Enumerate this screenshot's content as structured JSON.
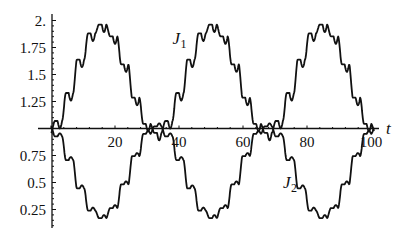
{
  "chart_data": {
    "type": "line",
    "title": "",
    "xlabel": "t",
    "ylabel": "",
    "xlim": [
      0,
      102
    ],
    "ylim": [
      0.1,
      2.05
    ],
    "axis_origin": {
      "x": 0,
      "y": 1.0
    },
    "grid": false,
    "legend": "inline labels",
    "x_ticks": [
      20,
      40,
      60,
      80,
      100
    ],
    "x_tick_labels": [
      "20",
      "40",
      "60",
      "80",
      "100"
    ],
    "y_ticks": [
      2.0,
      1.75,
      1.5,
      1.25,
      0.75,
      0.5,
      0.25
    ],
    "y_tick_labels": [
      "2.",
      "1.75",
      "1.5",
      "1.25",
      "0.75",
      "0.5",
      "0.25"
    ],
    "annotations": [
      {
        "text": "J",
        "subscript": "1",
        "x": 38,
        "y": 1.78,
        "series": "J1"
      },
      {
        "text": "J",
        "subscript": "2",
        "x": 72.5,
        "y": 0.45,
        "series": "J2"
      }
    ],
    "series": [
      {
        "name": "J1",
        "x": [
          0,
          5,
          10,
          13,
          15,
          17,
          19,
          22,
          25,
          28,
          31,
          34,
          36,
          40,
          45,
          48,
          50,
          52,
          54,
          57,
          60,
          63,
          66,
          69,
          72,
          75,
          80,
          83,
          85,
          87,
          89,
          92,
          95,
          98,
          101
        ],
        "y": [
          1.05,
          1.3,
          1.6,
          1.8,
          1.93,
          2.0,
          1.92,
          1.72,
          1.45,
          1.2,
          1.08,
          1.02,
          1.05,
          1.3,
          1.62,
          1.82,
          1.95,
          2.0,
          1.93,
          1.73,
          1.45,
          1.2,
          1.08,
          1.02,
          1.05,
          1.25,
          1.62,
          1.82,
          1.95,
          2.0,
          1.93,
          1.72,
          1.45,
          1.2,
          1.05
        ]
      },
      {
        "name": "J2",
        "x": [
          0,
          5,
          10,
          13,
          15,
          17,
          19,
          22,
          25,
          28,
          31,
          34,
          36,
          40,
          45,
          48,
          50,
          52,
          54,
          57,
          60,
          63,
          66,
          69,
          72,
          75,
          80,
          83,
          85,
          87,
          89,
          92,
          95,
          98,
          101
        ],
        "y": [
          0.98,
          0.8,
          0.5,
          0.3,
          0.2,
          0.15,
          0.22,
          0.35,
          0.6,
          0.85,
          0.97,
          1.0,
          0.98,
          0.78,
          0.45,
          0.27,
          0.18,
          0.15,
          0.2,
          0.35,
          0.6,
          0.85,
          0.97,
          1.0,
          0.98,
          0.8,
          0.45,
          0.27,
          0.18,
          0.15,
          0.2,
          0.35,
          0.6,
          0.85,
          0.98
        ]
      }
    ],
    "model": {
      "period": 34.5,
      "phase_peak_t": 17,
      "amplitude": 0.85,
      "ripple_period": 3.45,
      "ripple_amplitude": 0.07
    }
  }
}
